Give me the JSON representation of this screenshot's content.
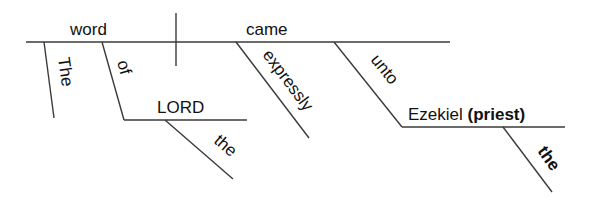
{
  "diagram": {
    "type": "Reed-Kellogg sentence diagram",
    "sentence_parts": {
      "subject": "word",
      "predicate": "came",
      "subject_modifiers": {
        "article": "The",
        "preposition": "of",
        "prep_object": "LORD",
        "prep_object_article": "the"
      },
      "predicate_modifiers": {
        "adverb": "expressly",
        "preposition": "unto",
        "prep_object": "Ezekiel",
        "appositive": "(priest)",
        "appositive_article": "the"
      }
    },
    "colors": {
      "line": "#3a3a3a",
      "text": "#111111",
      "background": "#ffffff"
    }
  }
}
